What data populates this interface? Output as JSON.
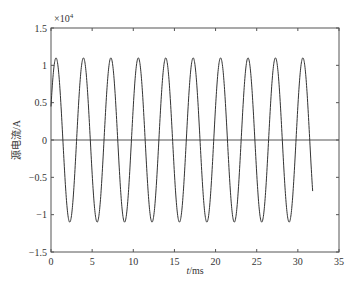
{
  "chart_data": {
    "type": "line",
    "title": "",
    "xlabel": "t/ms",
    "xlabel_italic_part": "t",
    "xlabel_unit": "/ms",
    "ylabel": "源电流/A",
    "y_exponent_label": "×10",
    "y_exponent_power": "4",
    "xlim": [
      0,
      35
    ],
    "ylim": [
      -1.5,
      1.5
    ],
    "x_ticks": [
      0,
      5,
      10,
      15,
      20,
      25,
      30,
      35
    ],
    "y_ticks": [
      -1.5,
      -1,
      -0.5,
      0,
      0.5,
      1,
      1.5
    ],
    "x_tick_labels": [
      "0",
      "5",
      "10",
      "15",
      "20",
      "25",
      "30",
      "35"
    ],
    "y_tick_labels": [
      "−1.5",
      "−1",
      "−0.5",
      "0",
      "0.5",
      "1",
      "1.5"
    ],
    "grid": false,
    "zero_line": true,
    "series": [
      {
        "name": "source current",
        "color": "#333333",
        "model": "sinusoid",
        "amplitude": 1.1,
        "frequency_per_ms": 0.3,
        "phase_rad": 0.42,
        "t_start": 0,
        "t_end": 31.8,
        "samples": 1200,
        "approx_points": [
          {
            "t": 0,
            "y": 0.45
          },
          {
            "t": 0.8,
            "y": 1.1
          },
          {
            "t": 2.4,
            "y": -1.1
          },
          {
            "t": 31.8,
            "y": -0.9
          }
        ]
      }
    ],
    "legend": null
  },
  "colors": {
    "axis": "#555555",
    "line": "#333333",
    "background": "#ffffff"
  }
}
